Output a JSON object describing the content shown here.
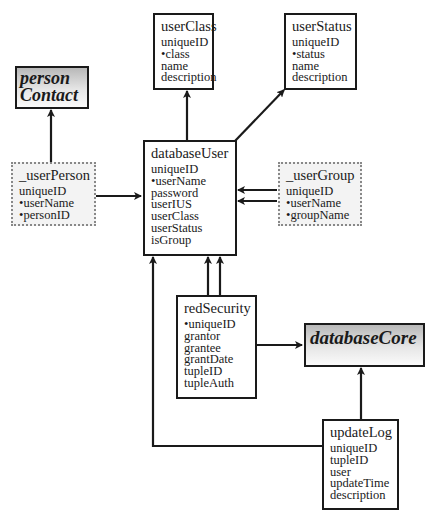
{
  "diagram": {
    "type": "entity-relationship",
    "entities": [
      {
        "id": "personContact",
        "title": "person Contact",
        "title_lines": [
          "person",
          "Contact"
        ],
        "style": "core",
        "fields": []
      },
      {
        "id": "userClass",
        "title": "userClass",
        "style": "solid",
        "fields": [
          "uniqueID",
          "•class",
          "name",
          "description"
        ]
      },
      {
        "id": "userStatus",
        "title": "userStatus",
        "style": "solid",
        "fields": [
          "uniqueID",
          "•status",
          "name",
          "description"
        ]
      },
      {
        "id": "_userPerson",
        "title": "_userPerson",
        "style": "dotted",
        "fields": [
          "uniqueID",
          "•userName",
          "•personID"
        ]
      },
      {
        "id": "databaseUser",
        "title": "databaseUser",
        "style": "solid",
        "fields": [
          "uniqueID",
          "•userName",
          "password",
          "userIUS",
          "userClass",
          "userStatus",
          "isGroup"
        ]
      },
      {
        "id": "_userGroup",
        "title": "_userGroup",
        "style": "dotted",
        "fields": [
          "uniqueID",
          "•userName",
          "•groupName"
        ]
      },
      {
        "id": "redSecurity",
        "title": "redSecurity",
        "style": "solid",
        "fields": [
          "•uniqueID",
          "grantor",
          "grantee",
          "grantDate",
          "tupleID",
          "tupleAuth"
        ]
      },
      {
        "id": "databaseCore",
        "title": "databaseCore",
        "style": "core",
        "fields": []
      },
      {
        "id": "updateLog",
        "title": "updateLog",
        "style": "solid",
        "fields": [
          "uniqueID",
          "tupleID",
          "user",
          "updateTime",
          "description"
        ]
      }
    ],
    "relationships": [
      {
        "from": "_userPerson",
        "to": "personContact"
      },
      {
        "from": "_userPerson",
        "to": "databaseUser"
      },
      {
        "from": "databaseUser",
        "to": "userClass"
      },
      {
        "from": "databaseUser",
        "to": "userStatus"
      },
      {
        "from": "_userGroup",
        "to": "databaseUser",
        "count": 2
      },
      {
        "from": "redSecurity",
        "to": "databaseUser",
        "count": 2
      },
      {
        "from": "redSecurity",
        "to": "databaseCore"
      },
      {
        "from": "updateLog",
        "to": "databaseUser"
      },
      {
        "from": "updateLog",
        "to": "databaseCore"
      }
    ]
  }
}
